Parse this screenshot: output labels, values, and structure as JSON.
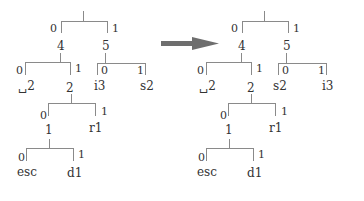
{
  "diagram": {
    "arrow": {
      "color": "#6e6e6e",
      "direction": "right"
    },
    "left_tree": {
      "root": {
        "edge_left": "0",
        "edge_right": "1",
        "children": [
          "4",
          "5"
        ]
      },
      "node_4": {
        "label": "4",
        "edge_left": "0",
        "edge_right": "1",
        "children": [
          "␣2",
          "2"
        ]
      },
      "node_5": {
        "label": "5",
        "edge_left": "0",
        "edge_right": "1",
        "children": [
          "i3",
          "s2"
        ]
      },
      "node_2": {
        "label": "2",
        "edge_left": "0",
        "edge_right": "1",
        "children": [
          "1",
          "r1"
        ]
      },
      "node_1": {
        "label": "1",
        "edge_left": "0",
        "edge_right": "1",
        "children": [
          "esc",
          "d1"
        ]
      }
    },
    "right_tree": {
      "root": {
        "edge_left": "0",
        "edge_right": "1",
        "children": [
          "4",
          "5"
        ]
      },
      "node_4": {
        "label": "4",
        "edge_left": "0",
        "edge_right": "1",
        "children": [
          "␣2",
          "2"
        ]
      },
      "node_5": {
        "label": "5",
        "edge_left": "0",
        "edge_right": "1",
        "children": [
          "s2",
          "i3"
        ]
      },
      "node_2": {
        "label": "2",
        "edge_left": "0",
        "edge_right": "1",
        "children": [
          "1",
          "r1"
        ]
      },
      "node_1": {
        "label": "1",
        "edge_left": "0",
        "edge_right": "1",
        "children": [
          "esc",
          "d1"
        ]
      }
    }
  }
}
